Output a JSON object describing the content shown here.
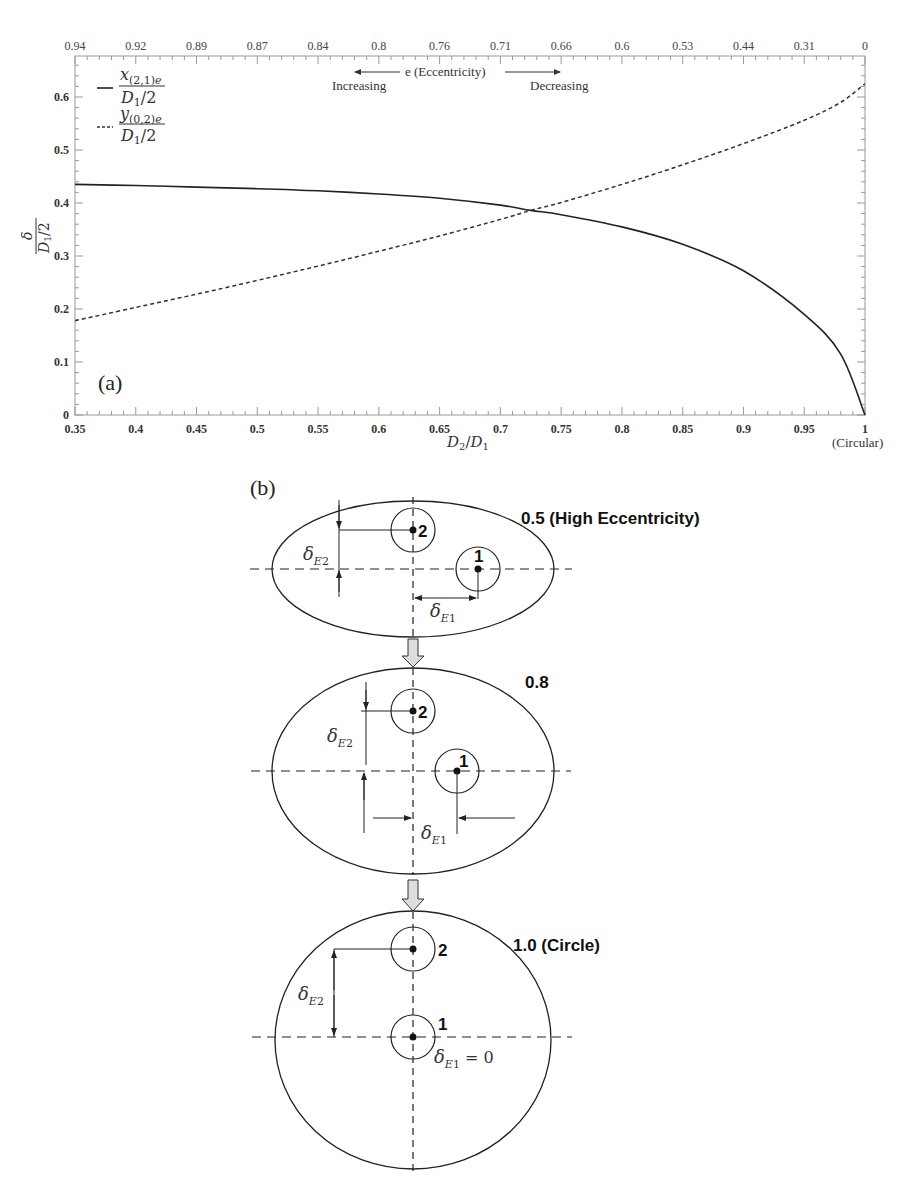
{
  "figure": {
    "panel_a_label": "(a)",
    "panel_b_label": "(b)"
  },
  "chart_data": {
    "type": "line",
    "title": "",
    "xlabel": "D2/D1",
    "xlabel_note": "(Circular)",
    "ylabel": "δ / (D1/2)",
    "xlim": [
      0.35,
      1.0
    ],
    "ylim": [
      0,
      0.67
    ],
    "x_ticks": [
      "0.35",
      "0.4",
      "0.45",
      "0.5",
      "0.55",
      "0.6",
      "0.65",
      "0.7",
      "0.75",
      "0.8",
      "0.85",
      "0.9",
      "0.95",
      "1"
    ],
    "y_ticks": [
      "0",
      "0.1",
      "0.2",
      "0.3",
      "0.4",
      "0.5",
      "0.6"
    ],
    "top_axis": {
      "label": "e (Eccentricity)",
      "left_note": "Increasing",
      "right_note": "Decreasing",
      "ticks": [
        "0.94",
        "0.92",
        "0.89",
        "0.87",
        "0.84",
        "0.8",
        "0.76",
        "0.71",
        "0.66",
        "0.6",
        "0.53",
        "0.44",
        "0.31",
        "0"
      ]
    },
    "grid": false,
    "legend_position": "upper-left",
    "x": [
      0.35,
      0.4,
      0.45,
      0.5,
      0.55,
      0.6,
      0.65,
      0.7,
      0.725,
      0.75,
      0.8,
      0.85,
      0.9,
      0.95,
      0.98,
      1.0
    ],
    "series": [
      {
        "name": "x_(2,1)e / (D1/2)",
        "style": "solid",
        "values": [
          0.435,
          0.433,
          0.43,
          0.427,
          0.423,
          0.417,
          0.409,
          0.396,
          0.386,
          0.378,
          0.355,
          0.322,
          0.272,
          0.19,
          0.115,
          0.0
        ]
      },
      {
        "name": "y_(0,2)e / (D1/2)",
        "style": "dashed",
        "values": [
          0.178,
          0.203,
          0.228,
          0.254,
          0.281,
          0.309,
          0.338,
          0.369,
          0.386,
          0.401,
          0.435,
          0.472,
          0.512,
          0.556,
          0.59,
          0.625
        ]
      }
    ],
    "legend": [
      {
        "label_num": "x(2,1)e",
        "label_den": "D1/2",
        "style": "solid"
      },
      {
        "label_num": "y(0,2)e",
        "label_den": "D1/2",
        "style": "dashed"
      }
    ]
  },
  "diagram": {
    "stages": [
      {
        "label": "0.5 (High Eccentricity)",
        "hole1": "1",
        "hole2": "2",
        "delta_e1": "δE1",
        "delta_e2": "δE2"
      },
      {
        "label": "0.8",
        "hole1": "1",
        "hole2": "2",
        "delta_e1": "δE1",
        "delta_e2": "δE2"
      },
      {
        "label": "1.0 (Circle)",
        "hole1": "1",
        "hole2": "2",
        "delta_e1": "δE1 = 0",
        "delta_e2": "δE2"
      }
    ]
  }
}
